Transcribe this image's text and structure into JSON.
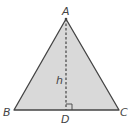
{
  "diagram": {
    "shape": "triangle",
    "vertices": {
      "A": {
        "label": "A",
        "x": 66,
        "y": 19
      },
      "B": {
        "label": "B",
        "x": 14,
        "y": 110
      },
      "C": {
        "label": "C",
        "x": 119,
        "y": 110
      }
    },
    "foot": {
      "label": "D",
      "x": 66,
      "y": 110
    },
    "altitude": {
      "label": "h",
      "from": "A",
      "to": "D",
      "style": "dashed"
    },
    "right_angle_marker": {
      "at": "D"
    },
    "colors": {
      "fill": "#d9d9d9",
      "stroke": "#444444",
      "background": "#ffffff"
    }
  }
}
